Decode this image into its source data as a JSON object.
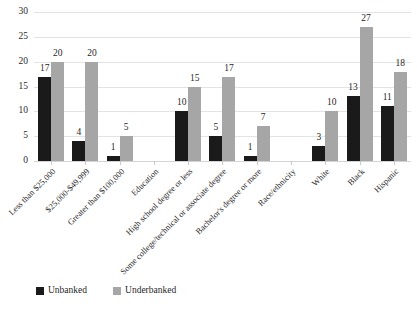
{
  "chart_data": {
    "type": "bar",
    "title": "",
    "xlabel": "",
    "ylabel": "",
    "ylim": [
      0,
      30
    ],
    "yticks": [
      0,
      5,
      10,
      15,
      20,
      25,
      30
    ],
    "grid": true,
    "legend_position": "bottom-left",
    "categories": [
      "Less than $25,000",
      "$25,000-$49,999",
      "Greater than $100,000",
      "Education",
      "High school degree or less",
      "Some college/technical or associate degree",
      "Bachelor's degree or more",
      "Race/ethnicity",
      "White",
      "Black",
      "Hispanic"
    ],
    "series": [
      {
        "name": "Unbanked",
        "color": "#1a1a1a",
        "values": [
          17,
          4,
          1,
          null,
          10,
          5,
          1,
          null,
          3,
          13,
          11
        ]
      },
      {
        "name": "Underbanked",
        "color": "#a6a6a6",
        "values": [
          20,
          20,
          5,
          null,
          15,
          17,
          7,
          null,
          10,
          27,
          18
        ]
      }
    ]
  },
  "legend": {
    "items": [
      {
        "label": "Unbanked",
        "color": "#1a1a1a",
        "swatch": "unbanked"
      },
      {
        "label": "Underbanked",
        "color": "#a6a6a6",
        "swatch": "underbanked"
      }
    ]
  }
}
